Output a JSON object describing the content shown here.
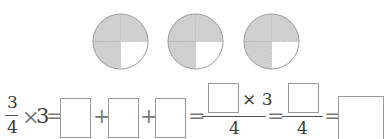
{
  "circles": {
    "count": 3,
    "parts_per_circle": 4,
    "shaded_parts": 3,
    "shade_color": "#cfcfcf",
    "outline_color": "#9a9a9a"
  },
  "equation": {
    "fraction": {
      "numerator": "3",
      "denominator": "4"
    },
    "times": "×",
    "multiplier": "3",
    "equals": "=",
    "plus": "+",
    "step3_times": "× 3",
    "step3_denominator": "4",
    "step4_denominator": "4",
    "blank_boxes": [
      "",
      "",
      "",
      "",
      "",
      ""
    ]
  }
}
